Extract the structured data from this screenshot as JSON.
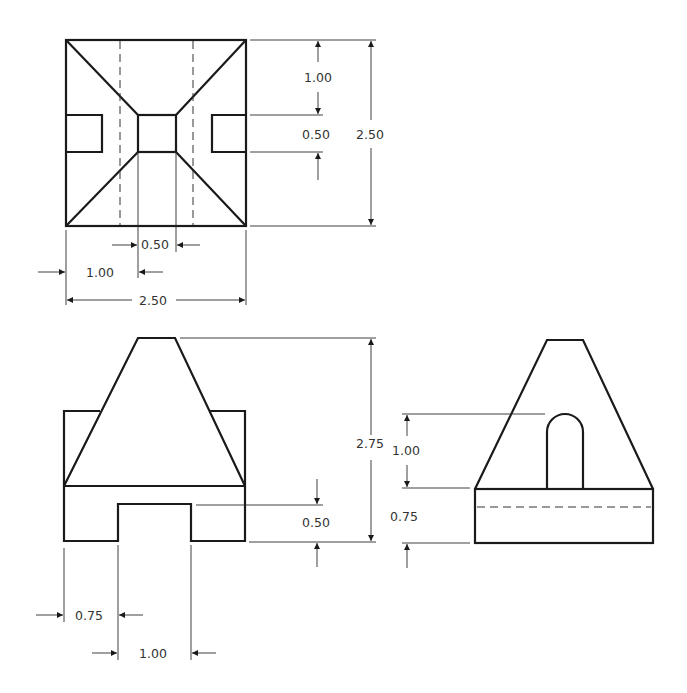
{
  "drawing": {
    "title": "Orthographic projection - pyramid block",
    "views": [
      "top-view",
      "front-view",
      "right-side-view"
    ],
    "line_colors": {
      "object": "#1a1a1a",
      "dimension": "#2a2a2a",
      "text": "#333333"
    }
  },
  "top_view": {
    "dims": {
      "upper_offset": "1.00",
      "slot_height": "0.50",
      "overall_height": "2.50",
      "center_width": "0.50",
      "left_offset": "1.00",
      "overall_width": "2.50"
    }
  },
  "front_view": {
    "dims": {
      "overall_height": "2.75",
      "notch_depth": "0.50",
      "left_offset": "0.75",
      "notch_width": "1.00"
    }
  },
  "side_view": {
    "dims": {
      "slot_height": "1.00",
      "base_height": "0.75"
    }
  }
}
